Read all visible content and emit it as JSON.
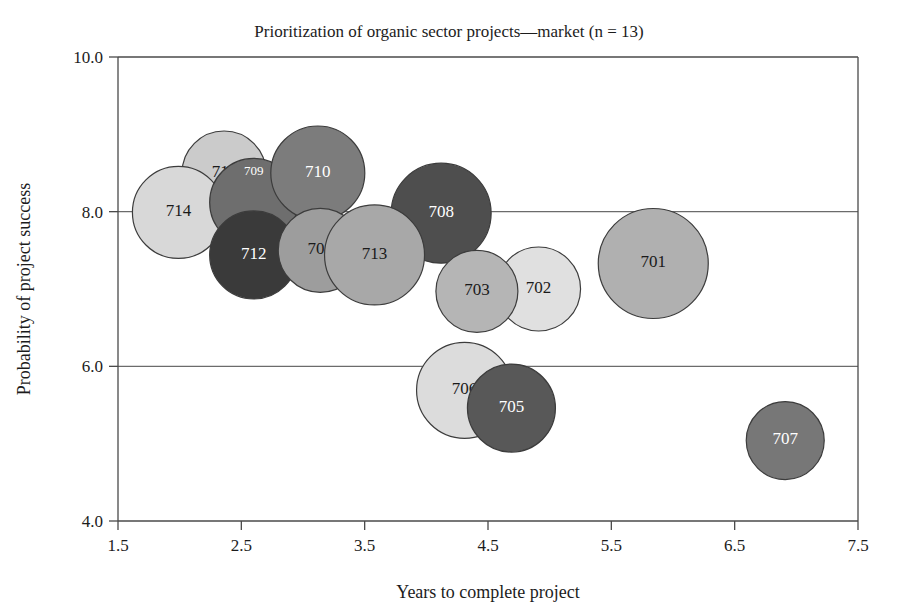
{
  "chart_data": {
    "type": "scatter",
    "title": "Prioritization of organic sector projects—market (n = 13)",
    "xlabel": "Years to complete project",
    "ylabel": "Probability of project success",
    "xlim": [
      1.5,
      7.5
    ],
    "ylim": [
      4.0,
      10.0
    ],
    "xticks": [
      "1.5",
      "2.5",
      "3.5",
      "4.5",
      "5.5",
      "6.5",
      "7.5"
    ],
    "yticks": [
      "4.0",
      "6.0",
      "8.0",
      "10.0"
    ],
    "grid": "horizontal",
    "legend": "none",
    "n": 13,
    "points": [
      {
        "label": "701",
        "x": 5.84,
        "y": 7.33,
        "size": 55,
        "color": "#b0b0b0",
        "text_color": "#1a1a1a"
      },
      {
        "label": "702",
        "x": 4.91,
        "y": 7.0,
        "size": 42,
        "color": "#e0e0e0",
        "text_color": "#1a1a1a"
      },
      {
        "label": "703",
        "x": 4.41,
        "y": 6.97,
        "size": 41,
        "color": "#b5b5b5",
        "text_color": "#1a1a1a"
      },
      {
        "label": "704",
        "x": 3.14,
        "y": 7.5,
        "size": 42,
        "color": "#9d9d9d",
        "text_color": "#1a1a1a"
      },
      {
        "label": "705",
        "x": 4.69,
        "y": 5.46,
        "size": 44,
        "color": "#585858",
        "text_color": "#ffffff"
      },
      {
        "label": "706",
        "x": 4.31,
        "y": 5.69,
        "size": 48,
        "color": "#dcdcdc",
        "text_color": "#1a1a1a"
      },
      {
        "label": "707",
        "x": 6.91,
        "y": 5.04,
        "size": 39,
        "color": "#777777",
        "text_color": "#ffffff"
      },
      {
        "label": "708",
        "x": 4.12,
        "y": 7.98,
        "size": 50,
        "color": "#4e4e4e",
        "text_color": "#ffffff"
      },
      {
        "label": "709",
        "x": 2.6,
        "y": 8.12,
        "size": 44,
        "color": "#6e6e6e",
        "text_color": "#ffffff"
      },
      {
        "label": "710",
        "x": 3.12,
        "y": 8.5,
        "size": 47,
        "color": "#7c7c7c",
        "text_color": "#ffffff"
      },
      {
        "label": "711",
        "x": 2.36,
        "y": 8.5,
        "size": 42,
        "color": "#cbcbcb",
        "text_color": "#1a1a1a"
      },
      {
        "label": "712",
        "x": 2.6,
        "y": 7.44,
        "size": 44,
        "color": "#3a3a3a",
        "text_color": "#ffffff"
      },
      {
        "label": "713",
        "x": 3.58,
        "y": 7.44,
        "size": 50,
        "color": "#a8a8a8",
        "text_color": "#1a1a1a"
      },
      {
        "label": "714",
        "x": 1.99,
        "y": 7.99,
        "size": 46,
        "color": "#d8d8d8",
        "text_color": "#1a1a1a"
      }
    ],
    "draw_order": [
      "711",
      "714",
      "709",
      "710",
      "712",
      "704",
      "708",
      "713",
      "702",
      "703",
      "706",
      "705",
      "701",
      "707"
    ]
  },
  "figure": {
    "background_color": "#ffffff",
    "frame_color": "#4a4a4a",
    "grid_color": "#6b6b6b"
  }
}
